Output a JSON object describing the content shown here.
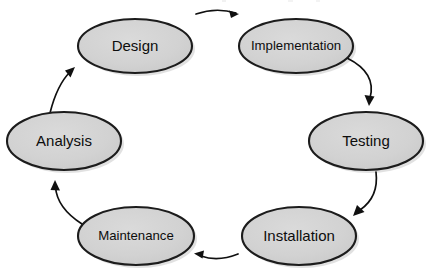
{
  "diagram": {
    "type": "cycle-diagram",
    "background_color": "#ffffff",
    "node_fill_color": "#d2d2d2",
    "node_stroke_color": "#1c1c1c",
    "arrow_color": "#101010",
    "text_color": "#0d0d0d",
    "nodes": [
      {
        "id": "design",
        "label": "Design",
        "cx": 135,
        "cy": 46,
        "rx": 57,
        "ry": 27,
        "font": "normal"
      },
      {
        "id": "implementation",
        "label": "Implementation",
        "cx": 296,
        "cy": 46,
        "rx": 57,
        "ry": 27,
        "font": "small"
      },
      {
        "id": "testing",
        "label": "Testing",
        "cx": 366,
        "cy": 141,
        "rx": 57,
        "ry": 29,
        "font": "normal"
      },
      {
        "id": "installation",
        "label": "Installation",
        "cx": 299,
        "cy": 236,
        "rx": 57,
        "ry": 29,
        "font": "normal"
      },
      {
        "id": "maintenance",
        "label": "Maintenance",
        "cx": 136,
        "cy": 236,
        "rx": 58,
        "ry": 29,
        "font": "small"
      },
      {
        "id": "analysis",
        "label": "Analysis",
        "cx": 64,
        "cy": 141,
        "rx": 57,
        "ry": 29,
        "font": "normal"
      }
    ],
    "edges": [
      {
        "id": "edge-design-implementation",
        "from": "design",
        "to": "implementation",
        "direction": "right",
        "path": "M 196 14 Q 216 7 236 13",
        "head": "M 237 10 L 230 11 L 234 17 Z"
      },
      {
        "id": "edge-implementation-testing",
        "from": "implementation",
        "to": "testing",
        "direction": "down-right",
        "path": "M 348 59 Q 376 74 370 99",
        "head": "M 370 105 L 366 96 L 374 96 Z"
      },
      {
        "id": "edge-testing-installation",
        "from": "testing",
        "to": "installation",
        "direction": "down-left",
        "path": "M 375 172 Q 377 197 359 211",
        "head": "M 354 215 L 357 206 L 363 211 Z"
      },
      {
        "id": "edge-installation-maintenance",
        "from": "installation",
        "to": "maintenance",
        "direction": "left",
        "path": "M 238 254 Q 218 262 200 256",
        "head": "M 195 254 L 203 251 L 202 258 Z"
      },
      {
        "id": "edge-maintenance-analysis",
        "from": "maintenance",
        "to": "analysis",
        "direction": "up-left",
        "path": "M 80 222 Q 56 207 55 186"
      },
      {
        "id": "edge-analysis-design",
        "from": "analysis",
        "to": "design",
        "direction": "up-right",
        "path": "M 52 112 Q 58 85 71 71"
      }
    ]
  }
}
